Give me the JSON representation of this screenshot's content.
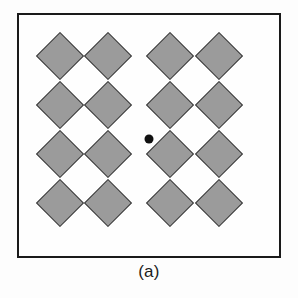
{
  "figure": {
    "caption": "(a)",
    "panel_label": "(a)",
    "frame": {
      "x": 17,
      "y": 13,
      "width": 264,
      "height": 245,
      "border_width": 2,
      "border_color": "#1a1a1a",
      "background_color": "#fefefe"
    },
    "colors": {
      "page_background": "#fdfdfd",
      "diamond_fill": "#9b9b9b",
      "diamond_outline": "#3a3a3a",
      "dot_color": "#101010",
      "caption_color": "#1b1b1b"
    },
    "center_dot": {
      "cx": 147,
      "cy": 137,
      "diameter": 9
    },
    "lattice": {
      "rows": 4,
      "columns": 4,
      "count": 16,
      "shape": "diamond",
      "rotation_deg": 45,
      "cell_size": 34,
      "column_centers": [
        58,
        106,
        168,
        217
      ],
      "row_centers": [
        54,
        103,
        152,
        201
      ],
      "items": [
        {
          "row": 1,
          "col": 1,
          "cx": 58,
          "cy": 54,
          "size": 34
        },
        {
          "row": 1,
          "col": 2,
          "cx": 106,
          "cy": 54,
          "size": 34
        },
        {
          "row": 1,
          "col": 3,
          "cx": 168,
          "cy": 54,
          "size": 34
        },
        {
          "row": 1,
          "col": 4,
          "cx": 217,
          "cy": 54,
          "size": 34
        },
        {
          "row": 2,
          "col": 1,
          "cx": 58,
          "cy": 103,
          "size": 34
        },
        {
          "row": 2,
          "col": 2,
          "cx": 106,
          "cy": 103,
          "size": 34
        },
        {
          "row": 2,
          "col": 3,
          "cx": 168,
          "cy": 103,
          "size": 34
        },
        {
          "row": 2,
          "col": 4,
          "cx": 217,
          "cy": 103,
          "size": 34
        },
        {
          "row": 3,
          "col": 1,
          "cx": 58,
          "cy": 152,
          "size": 34
        },
        {
          "row": 3,
          "col": 2,
          "cx": 106,
          "cy": 152,
          "size": 34
        },
        {
          "row": 3,
          "col": 3,
          "cx": 168,
          "cy": 152,
          "size": 34
        },
        {
          "row": 3,
          "col": 4,
          "cx": 217,
          "cy": 152,
          "size": 34
        },
        {
          "row": 4,
          "col": 1,
          "cx": 58,
          "cy": 201,
          "size": 34
        },
        {
          "row": 4,
          "col": 2,
          "cx": 106,
          "cy": 201,
          "size": 34
        },
        {
          "row": 4,
          "col": 3,
          "cx": 168,
          "cy": 201,
          "size": 34
        },
        {
          "row": 4,
          "col": 4,
          "cx": 217,
          "cy": 201,
          "size": 34
        }
      ]
    }
  }
}
